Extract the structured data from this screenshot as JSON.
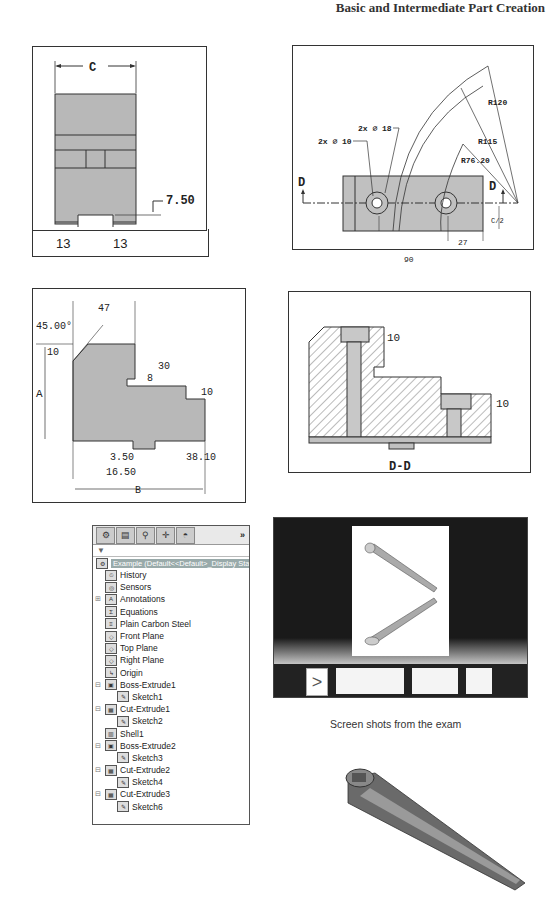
{
  "header": {
    "title": "Basic and Intermediate Part Creation"
  },
  "drawing1": {
    "dim_c": "C",
    "dim_750": "7.50",
    "dim_13a": "13",
    "dim_13b": "13"
  },
  "drawing2": {
    "hole1": "2x ⌀ 10",
    "hole2": "2x ⌀ 18",
    "r120": "R120",
    "r115": "R115",
    "r7620": "R76.20",
    "section_left": "D",
    "section_right": "D",
    "c_half": "C/2",
    "dim27": "27",
    "dim90": "90"
  },
  "drawing3": {
    "angle": "45.00°",
    "dim47": "47",
    "dim10a": "10",
    "dim30": "30",
    "dim8": "8",
    "dim10b": "10",
    "dimA": "A",
    "dim350": "3.50",
    "dim3810": "38.10",
    "dim1650": "16.50",
    "dimB": "B"
  },
  "drawing4": {
    "dim10a": "10",
    "dim10b": "10",
    "label": "D-D"
  },
  "feature_manager": {
    "tabs": [
      "feature-tree",
      "property-manager",
      "configuration-manager",
      "dimxpert-manager",
      "display-manager"
    ],
    "more": "»",
    "root": "Example (Default<<Default>_Display State 1>)",
    "items": [
      {
        "label": "History",
        "icon": "history-icon",
        "level": 1
      },
      {
        "label": "Sensors",
        "icon": "sensors-icon",
        "level": 1
      },
      {
        "label": "Annotations",
        "icon": "annotations-icon",
        "level": 1,
        "expand": "+"
      },
      {
        "label": "Equations",
        "icon": "equations-icon",
        "level": 1
      },
      {
        "label": "Plain Carbon Steel",
        "icon": "material-icon",
        "level": 1
      },
      {
        "label": "Front Plane",
        "icon": "plane-icon",
        "level": 1
      },
      {
        "label": "Top Plane",
        "icon": "plane-icon",
        "level": 1
      },
      {
        "label": "Right Plane",
        "icon": "plane-icon",
        "level": 1
      },
      {
        "label": "Origin",
        "icon": "origin-icon",
        "level": 1
      },
      {
        "label": "Boss-Extrude1",
        "icon": "boss-extrude-icon",
        "level": 1,
        "expand": "-"
      },
      {
        "label": "Sketch1",
        "icon": "sketch-icon",
        "level": 2
      },
      {
        "label": "Cut-Extrude1",
        "icon": "cut-extrude-icon",
        "level": 1,
        "expand": "-"
      },
      {
        "label": "Sketch2",
        "icon": "sketch-icon",
        "level": 2
      },
      {
        "label": "Shell1",
        "icon": "shell-icon",
        "level": 1
      },
      {
        "label": "Boss-Extrude2",
        "icon": "boss-extrude-icon",
        "level": 1,
        "expand": "-"
      },
      {
        "label": "Sketch3",
        "icon": "sketch-icon",
        "level": 2
      },
      {
        "label": "Cut-Extrude2",
        "icon": "cut-extrude-icon",
        "level": 1,
        "expand": "-"
      },
      {
        "label": "Sketch4",
        "icon": "sketch-icon",
        "level": 2
      },
      {
        "label": "Cut-Extrude3",
        "icon": "cut-extrude-icon",
        "level": 1,
        "expand": "-"
      },
      {
        "label": "Sketch6",
        "icon": "sketch-icon",
        "level": 2
      }
    ]
  },
  "viewer": {
    "thumbnails": 4
  },
  "caption": "Screen shots from the exam"
}
